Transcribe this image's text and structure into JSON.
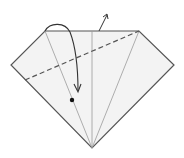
{
  "diagram": {
    "type": "origami-fold-step",
    "colors": {
      "paper_fill": "#f2f2f2",
      "edge": "#555555",
      "crease": "#999999",
      "dashed_fold": "#555555",
      "arrow": "#333333",
      "dot": "#111111"
    },
    "paper_polygon": [
      [
        45,
        31
      ],
      [
        139,
        31
      ],
      [
        174,
        65
      ],
      [
        92,
        148
      ],
      [
        11,
        65
      ]
    ],
    "creases": [
      {
        "from": [
          45,
          31
        ],
        "to": [
          92,
          148
        ]
      },
      {
        "from": [
          92,
          31
        ],
        "to": [
          92,
          148
        ]
      },
      {
        "from": [
          139,
          31
        ],
        "to": [
          92,
          148
        ]
      }
    ],
    "valley_fold_line": {
      "from": [
        25,
        80
      ],
      "to": [
        139,
        31
      ]
    },
    "fold_arrow": {
      "start": [
        45,
        31
      ],
      "apex": [
        57,
        25
      ],
      "end": [
        78,
        92
      ]
    },
    "push_back_arrow": {
      "from": [
        99,
        31
      ],
      "to": [
        107,
        14
      ]
    },
    "reference_dot": [
      72,
      100
    ]
  }
}
